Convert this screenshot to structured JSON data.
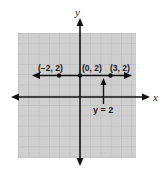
{
  "diagram": {
    "type": "coordinate-plane",
    "axes": {
      "x_label": "x",
      "y_label": "y"
    },
    "grid": {
      "x_range": [
        -6,
        5
      ],
      "y_range": [
        -6,
        6
      ],
      "fill": "#cfcfcf",
      "line_color": "#8a8a8a"
    },
    "line": {
      "equation": "y = 2",
      "label": "y = 2"
    },
    "points": [
      {
        "label": "(−2, 2)",
        "x": -2,
        "y": 2
      },
      {
        "label": "(0, 2)",
        "x": 0,
        "y": 2
      },
      {
        "label": "(3, 2)",
        "x": 3,
        "y": 2
      }
    ]
  }
}
